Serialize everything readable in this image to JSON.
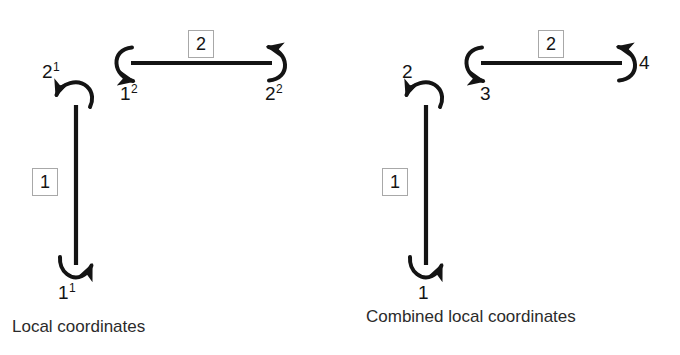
{
  "figure": {
    "background": "#ffffff",
    "ink_color": "#141414",
    "box_border_color": "#a8a8a8"
  },
  "panels": [
    {
      "id": "local-coordinates",
      "caption": "Local coordinates",
      "elements": [
        {
          "id": "element-1",
          "tag": "1",
          "orientation": "vertical",
          "nodes": [
            {
              "id": "node-top",
              "base": "2",
              "sup": "1"
            },
            {
              "id": "node-bottom",
              "base": "1",
              "sup": "1"
            }
          ]
        },
        {
          "id": "element-2",
          "tag": "2",
          "orientation": "horizontal",
          "nodes": [
            {
              "id": "node-left",
              "base": "1",
              "sup": "2"
            },
            {
              "id": "node-right",
              "base": "2",
              "sup": "2"
            }
          ]
        }
      ]
    },
    {
      "id": "combined-local-coordinates",
      "caption": "Combined local coordinates",
      "elements": [
        {
          "id": "element-1",
          "tag": "1",
          "orientation": "vertical",
          "nodes": [
            {
              "id": "node-top",
              "base": "2",
              "sup": ""
            },
            {
              "id": "node-bottom",
              "base": "1",
              "sup": ""
            }
          ]
        },
        {
          "id": "element-2",
          "tag": "2",
          "orientation": "horizontal",
          "nodes": [
            {
              "id": "node-left",
              "base": "3",
              "sup": ""
            },
            {
              "id": "node-right",
              "base": "4",
              "sup": ""
            }
          ]
        }
      ]
    }
  ]
}
